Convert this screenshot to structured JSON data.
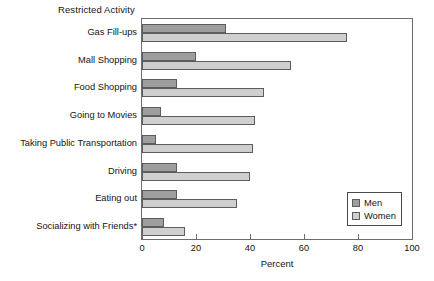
{
  "chart_data": {
    "type": "bar",
    "orientation": "horizontal",
    "title": "Restricted Activity",
    "xlabel": "Percent",
    "ylabel": "",
    "xlim": [
      0,
      100
    ],
    "xticks": [
      0,
      20,
      40,
      60,
      80,
      100
    ],
    "grid": false,
    "legend_position": "inside-bottom-right",
    "categories": [
      "Gas Fill-ups",
      "Mall Shopping",
      "Food Shopping",
      "Going to Movies",
      "Taking Public Transportation",
      "Driving",
      "Eating out",
      "Socializing with Friends*"
    ],
    "series": [
      {
        "name": "Men",
        "color": "#9e9e9e",
        "values": [
          31,
          20,
          13,
          7,
          5,
          13,
          13,
          8
        ]
      },
      {
        "name": "Women",
        "color": "#cfcfcf",
        "values": [
          76,
          55,
          45,
          42,
          41,
          40,
          35,
          16
        ]
      }
    ],
    "footnote": "*"
  },
  "legend": {
    "items": [
      {
        "label": "Men"
      },
      {
        "label": "Women"
      }
    ]
  }
}
